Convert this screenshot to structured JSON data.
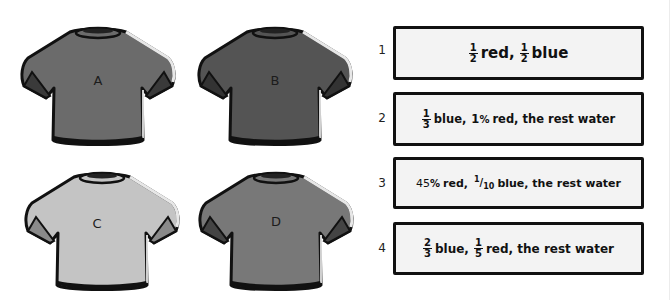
{
  "shirts": [
    {
      "label": "A",
      "color": "#6b6b6b"
    },
    {
      "label": "B",
      "color": "#545454"
    },
    {
      "label": "C",
      "color": "#c4c4c4"
    },
    {
      "label": "D",
      "color": "#787878"
    }
  ],
  "options": [
    {
      "number": "1",
      "parts": {
        "f1_num": "1",
        "f1_den": "2",
        "t1": "red,",
        "f2_num": "1",
        "f2_den": "2",
        "t2": "blue"
      }
    },
    {
      "number": "2",
      "parts": {
        "f1_num": "1",
        "f1_den": "3",
        "t1": "blue,",
        "v2": "1",
        "pct": "%",
        "t2": "red, the rest water"
      }
    },
    {
      "number": "3",
      "parts": {
        "v1": "45",
        "pct": "%",
        "t1": "red,",
        "f2_num": "1",
        "f2_den": "10",
        "t2": "blue, the rest water"
      }
    },
    {
      "number": "4",
      "parts": {
        "f1_num": "2",
        "f1_den": "3",
        "t1": "blue,",
        "f2_num": "1",
        "f2_den": "5",
        "t2": "red, the rest water"
      }
    }
  ],
  "colors": {
    "outline": "#111111",
    "box_fill": "#f3f3f3",
    "background": "#ffffff"
  }
}
